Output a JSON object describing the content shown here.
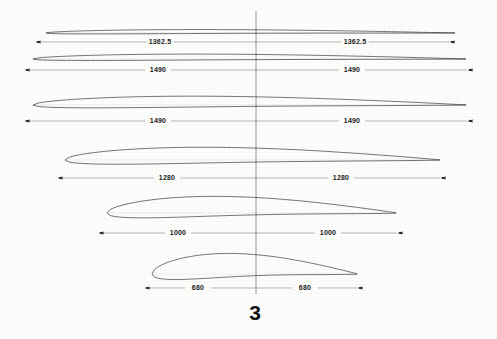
{
  "drawing": {
    "figure_number": "3",
    "centerline_x": 256,
    "sections": [
      {
        "id": "section-1",
        "name": "airfoil-section-1",
        "dim_left": "1362.5",
        "dim_right": "1362.5",
        "profile_left_x": 46,
        "profile_right_x": 455,
        "chord_y": 33,
        "thickness": 4.0,
        "camber": 1.5,
        "dim_y": 42,
        "dim_left_x": 38,
        "dim_right_x": 452,
        "label_left_x": 160,
        "label_right_x": 355
      },
      {
        "id": "section-2",
        "name": "airfoil-section-2",
        "dim_left": "1490",
        "dim_right": "1490",
        "profile_left_x": 33,
        "profile_right_x": 466,
        "chord_y": 59,
        "thickness": 6.0,
        "camber": 2.0,
        "dim_y": 70,
        "dim_left_x": 27,
        "dim_right_x": 470,
        "label_left_x": 158,
        "label_right_x": 352
      },
      {
        "id": "section-3",
        "name": "airfoil-section-3",
        "dim_left": "1490",
        "dim_right": "1490",
        "profile_left_x": 33,
        "profile_right_x": 466,
        "chord_y": 105,
        "thickness": 11.0,
        "camber": 3.5,
        "dim_y": 121,
        "dim_left_x": 27,
        "dim_right_x": 470,
        "label_left_x": 158,
        "label_right_x": 352
      },
      {
        "id": "section-4",
        "name": "airfoil-section-4",
        "dim_left": "1280",
        "dim_right": "1280",
        "profile_left_x": 65,
        "profile_right_x": 440,
        "chord_y": 160,
        "thickness": 16.0,
        "camber": 5.0,
        "dim_y": 178,
        "dim_left_x": 60,
        "dim_right_x": 443,
        "label_left_x": 167,
        "label_right_x": 341
      },
      {
        "id": "section-5",
        "name": "airfoil-section-5",
        "dim_left": "1000",
        "dim_right": "1000",
        "profile_left_x": 107,
        "profile_right_x": 396,
        "chord_y": 213,
        "thickness": 20.0,
        "camber": 7.0,
        "dim_y": 233,
        "dim_left_x": 101,
        "dim_right_x": 400,
        "label_left_x": 178,
        "label_right_x": 328
      },
      {
        "id": "section-6",
        "name": "airfoil-section-6",
        "dim_left": "680",
        "dim_right": "680",
        "profile_left_x": 152,
        "profile_right_x": 357,
        "chord_y": 274,
        "thickness": 24.0,
        "camber": 9.0,
        "dim_y": 288,
        "dim_left_x": 147,
        "dim_right_x": 360,
        "label_left_x": 198,
        "label_right_x": 305
      }
    ]
  },
  "colors": {
    "ink": "#1b1b1b",
    "line": "#2a2a2a",
    "paper": "#fdfdfc",
    "centerline": "#555555"
  }
}
